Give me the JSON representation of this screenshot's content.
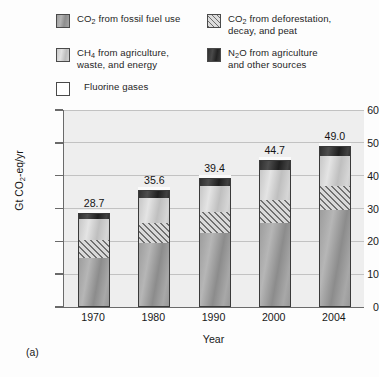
{
  "legend": {
    "items": [
      {
        "id": "co2-fossil",
        "label_html": "CO<sub>2</sub> from fossil fuel use",
        "label": "CO2 from fossil fuel use",
        "swatch": "gradient-gray-medium"
      },
      {
        "id": "co2-defor",
        "label_html": "CO<sub>2</sub> from deforestation,\ndecay, and peat",
        "label": "CO2 from deforestation, decay, and peat",
        "swatch": "diagonal-hatch"
      },
      {
        "id": "ch4",
        "label_html": "CH<sub>4</sub> from agriculture,\nwaste, and energy",
        "label": "CH4 from agriculture, waste, and energy",
        "swatch": "gradient-gray-light"
      },
      {
        "id": "n2o",
        "label_html": "N<sub>2</sub>O from agriculture\nand other sources",
        "label": "N2O from agriculture and other sources",
        "swatch": "gradient-dark"
      },
      {
        "id": "fluorine",
        "label_html": "Fluorine gases",
        "label": "Fluorine gases",
        "swatch": "white-outline"
      }
    ]
  },
  "panel_caption": "(a)",
  "chart_data": {
    "type": "bar",
    "subtype": "stacked",
    "title": "",
    "xlabel": "Year",
    "ylabel": "Gt CO2-eq/yr",
    "ylabel_html": "Gt CO<sub>2</sub>-eq/yr",
    "categories": [
      "1970",
      "1980",
      "1990",
      "2000",
      "2004"
    ],
    "ylim": [
      0,
      60
    ],
    "yticks": [
      0,
      10,
      20,
      30,
      40,
      50,
      60
    ],
    "ytick_labels": [
      "0",
      "10",
      "20",
      "30",
      "40",
      "50",
      "60"
    ],
    "grid": "horizontal",
    "legend_position": "above-plot",
    "totals": [
      28.7,
      35.6,
      39.4,
      44.7,
      49.0
    ],
    "total_labels": [
      "28.7",
      "35.6",
      "39.4",
      "44.7",
      "49.0"
    ],
    "series": [
      {
        "name": "CO2 from fossil fuel use",
        "key": "fossil",
        "values": [
          15.0,
          19.5,
          22.5,
          25.5,
          29.5
        ]
      },
      {
        "name": "CO2 from deforestation, decay, and peat",
        "key": "defor",
        "values": [
          5.5,
          6.0,
          6.3,
          7.0,
          7.4
        ]
      },
      {
        "name": "CH4 from agriculture, waste, and energy",
        "key": "ch4",
        "values": [
          6.3,
          7.8,
          8.1,
          9.3,
          9.2
        ]
      },
      {
        "name": "N2O from agriculture and other sources",
        "key": "n2o",
        "values": [
          1.9,
          2.3,
          2.5,
          2.9,
          2.9
        ]
      },
      {
        "name": "Fluorine gases",
        "key": "fluorine",
        "values": [
          0.0,
          0.0,
          0.0,
          0.0,
          0.0
        ]
      }
    ],
    "colors": {
      "fossil": "#a0a0a0",
      "defor": "#d9d9d9",
      "ch4": "#cfcfcf",
      "n2o": "#303030",
      "fluorine": "#ffffff",
      "plot_background": "#eeeeee",
      "gridline": "#c2c2c2",
      "axis": "#6a6a6a"
    }
  }
}
